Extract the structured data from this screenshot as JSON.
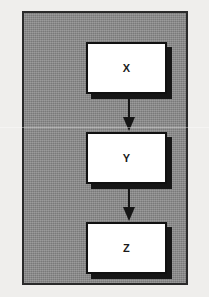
{
  "diagram": {
    "background_color": "#8a8a8a",
    "frame_color": "#2a2a2a",
    "node_fill": "#ffffff",
    "node_border_color": "#111111",
    "shadow_color": "#161616",
    "arrow_color": "#151515",
    "nodes": [
      {
        "id": "x",
        "label": "X"
      },
      {
        "id": "y",
        "label": "Y"
      },
      {
        "id": "z",
        "label": "Z"
      }
    ],
    "connectors": [
      {
        "id": "xy",
        "from": "X",
        "to": "Y",
        "icon": "arrow-down-icon"
      },
      {
        "id": "yz",
        "from": "Y",
        "to": "Z",
        "icon": "arrow-down-icon"
      }
    ]
  }
}
